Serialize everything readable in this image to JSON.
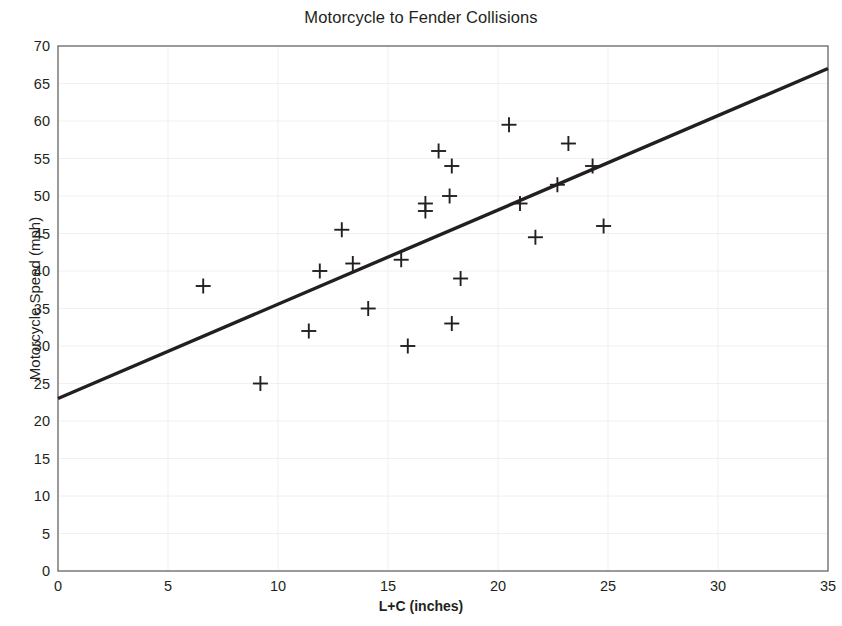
{
  "chart_data": {
    "type": "scatter",
    "title": "Motorcycle to Fender Collisions",
    "xlabel": "L+C (inches)",
    "ylabel": "Motorcycle Speed (mph)",
    "xlim": [
      0,
      35
    ],
    "ylim": [
      0,
      70
    ],
    "xticks": [
      0,
      5,
      10,
      15,
      20,
      25,
      30,
      35
    ],
    "yticks": [
      0,
      5,
      10,
      15,
      20,
      25,
      30,
      35,
      40,
      45,
      50,
      55,
      60,
      65,
      70
    ],
    "grid": true,
    "legend": null,
    "marker": "plus",
    "marker_color": "#231f20",
    "points": [
      {
        "x": 6.6,
        "y": 38.0
      },
      {
        "x": 9.2,
        "y": 25.0
      },
      {
        "x": 11.4,
        "y": 32.0
      },
      {
        "x": 11.9,
        "y": 40.0
      },
      {
        "x": 12.9,
        "y": 45.5
      },
      {
        "x": 13.4,
        "y": 41.0
      },
      {
        "x": 14.1,
        "y": 35.0
      },
      {
        "x": 15.6,
        "y": 41.5
      },
      {
        "x": 15.9,
        "y": 30.0
      },
      {
        "x": 16.7,
        "y": 48.0
      },
      {
        "x": 16.7,
        "y": 49.0
      },
      {
        "x": 17.3,
        "y": 56.0
      },
      {
        "x": 17.9,
        "y": 54.0
      },
      {
        "x": 17.8,
        "y": 50.0
      },
      {
        "x": 17.9,
        "y": 33.0
      },
      {
        "x": 18.3,
        "y": 39.0
      },
      {
        "x": 20.5,
        "y": 59.5
      },
      {
        "x": 21.0,
        "y": 49.0
      },
      {
        "x": 21.7,
        "y": 44.5
      },
      {
        "x": 22.7,
        "y": 51.5
      },
      {
        "x": 23.2,
        "y": 57.0
      },
      {
        "x": 24.3,
        "y": 54.0
      },
      {
        "x": 24.8,
        "y": 46.0
      }
    ],
    "trendline": {
      "type": "linear",
      "x0": 0,
      "y0": 23.0,
      "x1": 35,
      "y1": 67.0,
      "slope": 1.257,
      "intercept": 23.0,
      "color": "#231f20"
    }
  }
}
